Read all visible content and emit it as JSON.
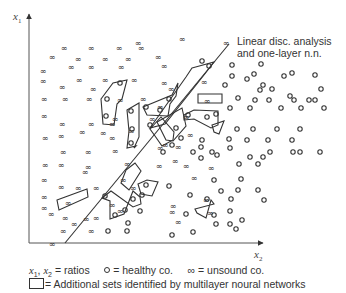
{
  "axes": {
    "y_label": "x",
    "y_sub": "1",
    "x_label": "x",
    "x_sub": "2"
  },
  "annotation": {
    "line1": "Linear disc. analysis",
    "line2": "and one-layer n.n."
  },
  "legend": {
    "vars": "x",
    "vars_sub1": "1",
    "vars_mid": ", ",
    "vars_x2": "x",
    "vars_sub2": "2",
    "ratios": "= ratios",
    "healthy": "= healthy co.",
    "unsound_symbol": "∞",
    "unsound": "= unsound co.",
    "polygon": "= Additional sets identified by multilayer noural networks"
  },
  "colors": {
    "ink": "#333333",
    "background": "#ffffff"
  },
  "chart_data": {
    "type": "scatter",
    "title": "",
    "xlabel": "x2",
    "ylabel": "x1",
    "grid": false,
    "legend_position": "bottom",
    "series": [
      {
        "name": "unsound co.",
        "marker": "infinity",
        "points_px": [
          [
            64,
            48
          ],
          [
            91,
            48
          ],
          [
            119,
            48
          ],
          [
            141,
            48
          ],
          [
            52,
            57
          ],
          [
            78,
            59
          ],
          [
            105,
            59
          ],
          [
            128,
            59
          ],
          [
            158,
            57
          ],
          [
            71,
            67
          ],
          [
            91,
            67
          ],
          [
            121,
            67
          ],
          [
            164,
            66
          ],
          [
            43,
            71
          ],
          [
            79,
            80
          ],
          [
            105,
            80
          ],
          [
            134,
            80
          ],
          [
            43,
            81
          ],
          [
            62,
            87
          ],
          [
            93,
            89
          ],
          [
            164,
            83
          ],
          [
            171,
            89
          ],
          [
            44,
            99
          ],
          [
            65,
            99
          ],
          [
            89,
            99
          ],
          [
            120,
            100
          ],
          [
            143,
            99
          ],
          [
            160,
            107
          ],
          [
            44,
            116
          ],
          [
            62,
            124
          ],
          [
            91,
            124
          ],
          [
            112,
            124
          ],
          [
            131,
            131
          ],
          [
            115,
            119
          ],
          [
            152,
            119
          ],
          [
            61,
            136
          ],
          [
            82,
            132
          ],
          [
            103,
            133
          ],
          [
            112,
            138
          ],
          [
            45,
            138
          ],
          [
            63,
            152
          ],
          [
            88,
            152
          ],
          [
            115,
            151
          ],
          [
            45,
            165
          ],
          [
            61,
            165
          ],
          [
            88,
            167
          ],
          [
            85,
            172
          ],
          [
            44,
            180
          ],
          [
            61,
            187
          ],
          [
            78,
            188
          ],
          [
            96,
            188
          ],
          [
            44,
            208
          ],
          [
            68,
            203
          ],
          [
            51,
            214
          ],
          [
            65,
            218
          ],
          [
            74,
            224
          ],
          [
            86,
            219
          ],
          [
            96,
            218
          ],
          [
            44,
            197
          ],
          [
            63,
            231
          ],
          [
            91,
            231
          ],
          [
            52,
            244
          ],
          [
            138,
            43
          ],
          [
            182,
            39
          ],
          [
            204,
            82
          ],
          [
            207,
            101
          ],
          [
            226,
            43
          ],
          [
            190,
            135
          ],
          [
            186,
            117
          ],
          [
            165,
            145
          ],
          [
            175,
            161
          ],
          [
            159,
            166
          ],
          [
            186,
            166
          ],
          [
            211,
            168
          ],
          [
            194,
            178
          ],
          [
            206,
            200
          ],
          [
            210,
            213
          ],
          [
            178,
            222
          ],
          [
            172,
            212
          ],
          [
            173,
            206
          ],
          [
            133,
            188
          ],
          [
            123,
            180
          ],
          [
            112,
            205
          ],
          [
            120,
            211
          ],
          [
            127,
            164
          ],
          [
            160,
            148
          ],
          [
            178,
            147
          ]
        ]
      },
      {
        "name": "healthy co.",
        "marker": "circle",
        "points_px": [
          [
            120,
            83
          ],
          [
            107,
            99
          ],
          [
            106,
            116
          ],
          [
            131,
            111
          ],
          [
            132,
            129
          ],
          [
            131,
            143
          ],
          [
            146,
            107
          ],
          [
            160,
            110
          ],
          [
            169,
            99
          ],
          [
            202,
            61
          ],
          [
            209,
            66
          ],
          [
            232,
            65
          ],
          [
            232,
            76
          ],
          [
            261,
            64
          ],
          [
            225,
            85
          ],
          [
            254,
            74
          ],
          [
            284,
            76
          ],
          [
            263,
            85
          ],
          [
            272,
            89
          ],
          [
            247,
            79
          ],
          [
            292,
            73
          ],
          [
            315,
            75
          ],
          [
            321,
            89
          ],
          [
            290,
            96
          ],
          [
            260,
            90
          ],
          [
            315,
            100
          ],
          [
            238,
            98
          ],
          [
            255,
            100
          ],
          [
            269,
            100
          ],
          [
            294,
            100
          ],
          [
            309,
            100
          ],
          [
            230,
            108
          ],
          [
            250,
            108
          ],
          [
            281,
            108
          ],
          [
            301,
            108
          ],
          [
            324,
            108
          ],
          [
            188,
            115
          ],
          [
            207,
            117
          ],
          [
            216,
            114
          ],
          [
            237,
            129
          ],
          [
            253,
            129
          ],
          [
            277,
            129
          ],
          [
            300,
            129
          ],
          [
            202,
            140
          ],
          [
            229,
            139
          ],
          [
            247,
            140
          ],
          [
            268,
            140
          ],
          [
            292,
            140
          ],
          [
            270,
            152
          ],
          [
            293,
            152
          ],
          [
            201,
            147
          ],
          [
            230,
            148
          ],
          [
            181,
            138
          ],
          [
            193,
            152
          ],
          [
            212,
            152
          ],
          [
            250,
            157
          ],
          [
            263,
            157
          ],
          [
            172,
            145
          ],
          [
            163,
            152
          ],
          [
            176,
            128
          ],
          [
            150,
            125
          ],
          [
            300,
            152
          ],
          [
            320,
            152
          ],
          [
            201,
            158
          ],
          [
            217,
            155
          ],
          [
            239,
            164
          ],
          [
            258,
            164
          ],
          [
            214,
            180
          ],
          [
            241,
            179
          ],
          [
            221,
            191
          ],
          [
            238,
            190
          ],
          [
            258,
            190
          ],
          [
            207,
            199
          ],
          [
            231,
            199
          ],
          [
            264,
            200
          ],
          [
            186,
            214
          ],
          [
            230,
            224
          ],
          [
            242,
            220
          ],
          [
            190,
            195
          ],
          [
            169,
            186
          ],
          [
            146,
            185
          ],
          [
            142,
            195
          ],
          [
            105,
            196
          ],
          [
            133,
            199
          ],
          [
            125,
            210
          ],
          [
            140,
            211
          ],
          [
            115,
            215
          ],
          [
            128,
            223
          ],
          [
            108,
            231
          ],
          [
            127,
            231
          ],
          [
            172,
            235
          ],
          [
            193,
            232
          ],
          [
            214,
            215
          ],
          [
            216,
            224
          ],
          [
            236,
            229
          ],
          [
            230,
            211
          ]
        ]
      }
    ],
    "decision_line_px": [
      [
        65,
        243
      ],
      [
        229,
        44
      ]
    ],
    "polygons_px": [
      [
        [
          101,
          99
        ],
        [
          113,
          83
        ],
        [
          127,
          80
        ],
        [
          122,
          99
        ],
        [
          117,
          104
        ],
        [
          114,
          125
        ],
        [
          103,
          124
        ]
      ],
      [
        [
          127,
          110
        ],
        [
          139,
          103
        ],
        [
          139,
          137
        ],
        [
          134,
          148
        ],
        [
          136,
          146
        ],
        [
          127,
          148
        ],
        [
          129,
          131
        ]
      ],
      [
        [
          143,
          107
        ],
        [
          172,
          95
        ],
        [
          178,
          83
        ],
        [
          176,
          96
        ],
        [
          170,
          104
        ],
        [
          168,
          116
        ],
        [
          147,
          115
        ]
      ],
      [
        [
          192,
          68
        ],
        [
          214,
          62
        ],
        [
          204,
          75
        ],
        [
          165,
          124
        ],
        [
          150,
          128
        ],
        [
          186,
          77
        ]
      ],
      [
        [
          198,
          94
        ],
        [
          222,
          94
        ],
        [
          222,
          103
        ],
        [
          198,
          103
        ]
      ],
      [
        [
          184,
          115
        ],
        [
          194,
          110
        ],
        [
          218,
          111
        ],
        [
          218,
          125
        ],
        [
          211,
          128
        ],
        [
          194,
          119
        ],
        [
          184,
          120
        ]
      ],
      [
        [
          212,
          125
        ],
        [
          224,
          121
        ],
        [
          219,
          134
        ],
        [
          214,
          132
        ]
      ],
      [
        [
          157,
          122
        ],
        [
          182,
          108
        ],
        [
          186,
          126
        ],
        [
          173,
          141
        ],
        [
          166,
          140
        ]
      ],
      [
        [
          150,
          129
        ],
        [
          161,
          117
        ],
        [
          174,
          132
        ],
        [
          173,
          140
        ],
        [
          162,
          146
        ],
        [
          155,
          136
        ]
      ],
      [
        [
          57,
          200
        ],
        [
          87,
          189
        ],
        [
          88,
          197
        ],
        [
          59,
          210
        ]
      ],
      [
        [
          126,
          170
        ],
        [
          135,
          163
        ],
        [
          141,
          171
        ],
        [
          129,
          190
        ],
        [
          121,
          183
        ]
      ],
      [
        [
          102,
          198
        ],
        [
          111,
          191
        ],
        [
          133,
          207
        ],
        [
          141,
          204
        ],
        [
          140,
          197
        ],
        [
          133,
          191
        ],
        [
          124,
          214
        ],
        [
          110,
          219
        ],
        [
          110,
          201
        ]
      ],
      [
        [
          138,
          184
        ],
        [
          147,
          180
        ],
        [
          158,
          182
        ],
        [
          152,
          196
        ],
        [
          141,
          194
        ]
      ],
      [
        [
          195,
          209
        ],
        [
          214,
          204
        ],
        [
          211,
          200
        ],
        [
          206,
          218
        ],
        [
          197,
          213
        ]
      ]
    ]
  }
}
